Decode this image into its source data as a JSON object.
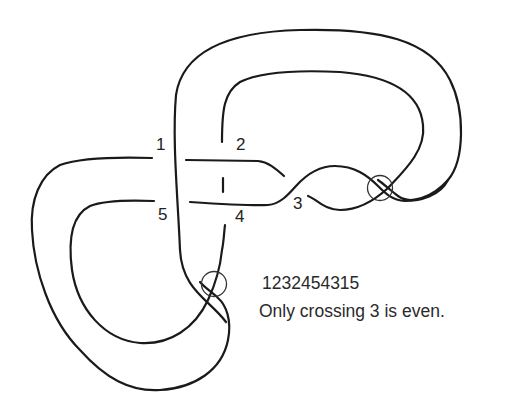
{
  "diagram": {
    "type": "virtual knot diagram",
    "crossing_labels": [
      "1",
      "2",
      "3",
      "4",
      "5"
    ],
    "virtual_crossings": 2,
    "stroke_color": "#1a1a1a"
  },
  "caption": {
    "gauss_sequence": "1232454315",
    "note": "Only crossing 3 is even."
  }
}
